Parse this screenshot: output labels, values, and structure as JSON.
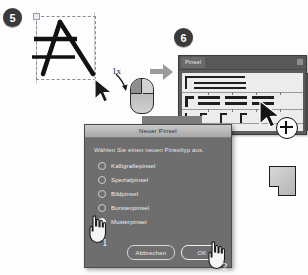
{
  "tutorial": {
    "steps": [
      {
        "number": "5",
        "name": "select-artwork"
      },
      {
        "number": "6",
        "name": "brushes-panel"
      }
    ],
    "click_hint": "1x",
    "order_markers": [
      "1",
      "2"
    ]
  },
  "panel": {
    "tab_label": "Pinsel",
    "menu_icon": "panel-menu-icon",
    "add_icon": "plus-circle-icon",
    "swatch_icon": "new-page-icon"
  },
  "dialog": {
    "title": "Neuer Pinsel",
    "prompt": "Wählen Sie einen neuen Pinseltyp aus.",
    "options": [
      {
        "label": "Kalligrafiepinsel",
        "selected": false
      },
      {
        "label": "Spezialpinsel",
        "selected": false
      },
      {
        "label": "Bildpinsel",
        "selected": false
      },
      {
        "label": "Borstenpinsel",
        "selected": false
      },
      {
        "label": "Musterpinsel",
        "selected": true
      }
    ],
    "cancel_label": "Abbrechen",
    "ok_label": "OK"
  },
  "colors": {
    "dialog_bg": "#6e6e6e",
    "panel_bg": "#5c5c5c",
    "badge_bg": "#3a3a3a",
    "stroke_area": "#ececec",
    "ink": "#1e1e1e"
  }
}
